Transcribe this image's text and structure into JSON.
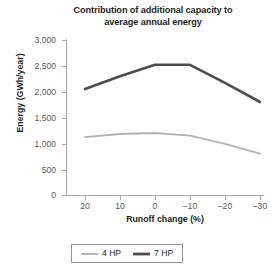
{
  "chart_data": {
    "type": "line",
    "title": "Contribution of additional capacity to average annual energy",
    "title_line1": "Contribution of additional capacity to",
    "title_line2": "average annual energy",
    "xlabel": "Runoff change (%)",
    "ylabel": "Energy (GWh/year)",
    "x": [
      20,
      10,
      0,
      -10,
      -20,
      -30
    ],
    "categories": [
      "20",
      "10",
      "0",
      "–10",
      "–20",
      "–30"
    ],
    "xtick_labels": [
      "20",
      "10",
      "0",
      "–10",
      "–20",
      "–30"
    ],
    "ytick_labels": [
      "0",
      "500",
      "1,000",
      "1,500",
      "2,000",
      "2,500",
      "3,000"
    ],
    "ytick_values": [
      0,
      500,
      1000,
      1500,
      2000,
      2500,
      3000
    ],
    "ylim": [
      0,
      3000
    ],
    "grid": false,
    "legend_position": "bottom-center",
    "series": [
      {
        "name": "4 HP",
        "color": "#b3b3b3",
        "width": 1.9,
        "values": [
          1120,
          1180,
          1200,
          1150,
          990,
          800
        ]
      },
      {
        "name": "7 HP",
        "color": "#4d4d4d",
        "width": 2.6,
        "values": [
          2050,
          2300,
          2520,
          2520,
          2170,
          1800
        ]
      }
    ]
  },
  "legend": {
    "items": [
      {
        "label": "4 HP"
      },
      {
        "label": "7 HP"
      }
    ]
  },
  "colors": {
    "axis": "#a7a9ac",
    "tick_text": "#58595b",
    "title_text": "#231f20",
    "series_light": "#b3b3b3",
    "series_dark": "#4d4d4d",
    "background": "#ffffff"
  }
}
